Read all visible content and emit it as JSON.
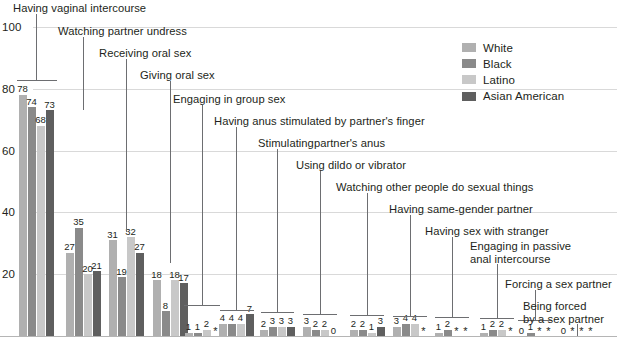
{
  "chart_data": {
    "type": "bar",
    "title": "",
    "xlabel": "",
    "ylabel": "",
    "ylim": [
      0,
      100
    ],
    "grid": true,
    "legend_position": "top-right",
    "yticks": [
      20,
      40,
      60,
      80,
      100
    ],
    "categories": [
      "Having vaginal intercourse",
      "Watching partner undress",
      "Receiving oral sex",
      "Giving oral sex",
      "Engaging in group sex",
      "Having anus stimulated by partner's finger",
      "Stimulatingpartner's anus",
      "Using dildo or vibrator",
      "Watching other people do sexual things",
      "Having same-gender partner",
      "Having sex with stranger",
      "Engaging in passive\nanal intercourse",
      "Forcing a sex partner",
      "Being forced\nby a sex partner"
    ],
    "series": [
      {
        "name": "White",
        "color": "#b0b0b0",
        "values": [
          78,
          27,
          31,
          18,
          1,
          4,
          2,
          3,
          2,
          3,
          1,
          1,
          0,
          0
        ],
        "labels": [
          "78",
          "27",
          "31",
          "18",
          "1",
          "4",
          "2",
          "3",
          "2",
          "3",
          "1",
          "1",
          "0",
          "0"
        ]
      },
      {
        "name": "Black",
        "color": "#8a8a8a",
        "values": [
          74,
          35,
          19,
          8,
          1,
          4,
          3,
          2,
          2,
          4,
          2,
          2,
          1,
          0
        ],
        "labels": [
          "74",
          "35",
          "19",
          "8",
          "1",
          "4",
          "3",
          "2",
          "2",
          "4",
          "2",
          "2",
          "1",
          "*"
        ]
      },
      {
        "name": "Latino",
        "color": "#c8c8c8",
        "values": [
          68,
          20,
          32,
          18,
          2,
          4,
          3,
          2,
          1,
          4,
          0,
          2,
          0,
          0
        ],
        "labels": [
          "68",
          "20",
          "32",
          "18",
          "2",
          "4",
          "3",
          "2",
          "1",
          "4",
          "*",
          "2",
          "*",
          "*"
        ]
      },
      {
        "name": "Asian American",
        "color": "#5f5f5f",
        "values": [
          73,
          21,
          27,
          17,
          0,
          7,
          3,
          0,
          3,
          0,
          0,
          0,
          0,
          0
        ],
        "labels": [
          "73",
          "21",
          "27",
          "17",
          "*",
          "7",
          "3",
          "0",
          "3",
          "*",
          "*",
          "*",
          "*",
          "*"
        ]
      }
    ]
  },
  "legend": {
    "items": [
      {
        "label": "White"
      },
      {
        "label": "Black"
      },
      {
        "label": "Latino"
      },
      {
        "label": "Asian American"
      }
    ]
  }
}
